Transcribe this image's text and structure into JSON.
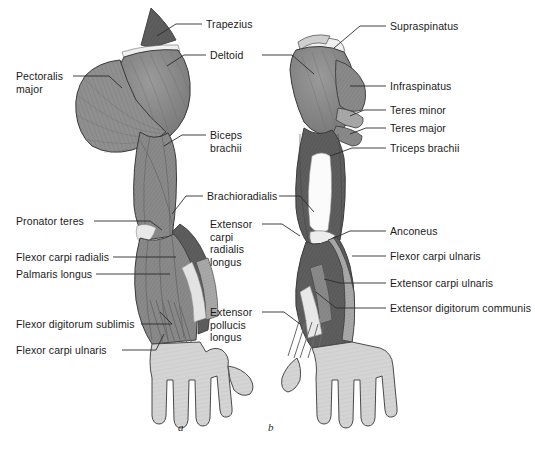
{
  "diagram": {
    "view_captions": [
      {
        "id": "a",
        "text": "a"
      },
      {
        "id": "b",
        "text": "b"
      }
    ],
    "colors": {
      "muscle_mid": "#8a8a8a",
      "muscle_dark": "#5c5c5c",
      "muscle_light": "#b0b0b0",
      "tendon_white": "#f2f2f2",
      "hand_light": "#d4d4d4",
      "outline": "#3a3a3a",
      "leader_line": "#2b2b2b",
      "text": "#1a1a1a",
      "background": "#ffffff"
    },
    "labels_left": [
      {
        "id": "pectoralis-major",
        "line1": "Pectoralis",
        "line2": "major"
      },
      {
        "id": "pronator-teres",
        "line1": "Pronator teres",
        "line2": ""
      },
      {
        "id": "flexor-carpi-radialis",
        "line1": "Flexor carpi radialis",
        "line2": ""
      },
      {
        "id": "palmaris-longus",
        "line1": "Palmaris longus",
        "line2": ""
      },
      {
        "id": "flexor-digitorum-sublimis",
        "line1": "Flexor digitorum sublimis",
        "line2": ""
      },
      {
        "id": "flexor-carpi-ulnaris",
        "line1": "Flexor carpi ulnaris",
        "line2": ""
      }
    ],
    "labels_center": [
      {
        "id": "trapezius",
        "line1": "Trapezius",
        "line2": "",
        "line3": "",
        "line4": ""
      },
      {
        "id": "deltoid",
        "line1": "Deltoid",
        "line2": "",
        "line3": "",
        "line4": ""
      },
      {
        "id": "biceps-brachii",
        "line1": "Biceps",
        "line2": "brachii",
        "line3": "",
        "line4": ""
      },
      {
        "id": "brachioradialis",
        "line1": "Brachioradialis",
        "line2": "",
        "line3": "",
        "line4": ""
      },
      {
        "id": "extensor-carpi-radialis-longus",
        "line1": "Extensor",
        "line2": "carpi",
        "line3": "radialis",
        "line4": "longus"
      },
      {
        "id": "extensor-pollucis-longus",
        "line1": "Extensor",
        "line2": "pollucis",
        "line3": "longus",
        "line4": ""
      }
    ],
    "labels_right": [
      {
        "id": "supraspinatus",
        "line1": "Supraspinatus"
      },
      {
        "id": "infraspinatus",
        "line1": "Infraspinatus"
      },
      {
        "id": "teres-minor",
        "line1": "Teres minor"
      },
      {
        "id": "teres-major",
        "line1": "Teres major"
      },
      {
        "id": "triceps-brachii",
        "line1": "Triceps brachii"
      },
      {
        "id": "anconeus",
        "line1": "Anconeus"
      },
      {
        "id": "flexor-carpi-ulnaris-post",
        "line1": "Flexor carpi ulnaris"
      },
      {
        "id": "extensor-carpi-ulnaris",
        "line1": "Extensor carpi ulnaris"
      },
      {
        "id": "extensor-digitorum-communis",
        "line1": "Extensor digitorum communis"
      }
    ]
  }
}
